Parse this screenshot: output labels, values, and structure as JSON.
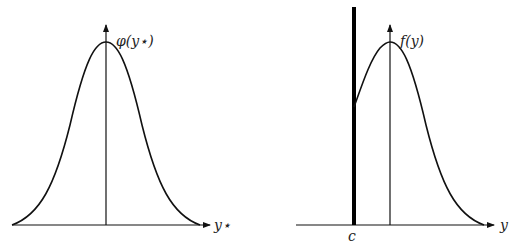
{
  "left_panel": {
    "title": "Standard normal density",
    "y_axis_label": "φ(y⋆)",
    "x_axis_label": "y⋆"
  },
  "right_panel": {
    "title": "Truncated density",
    "y_axis_label": "f(y)",
    "x_axis_label": "y",
    "truncation_label": "c"
  },
  "colors": {
    "stroke": "#111111",
    "background": "#ffffff"
  }
}
